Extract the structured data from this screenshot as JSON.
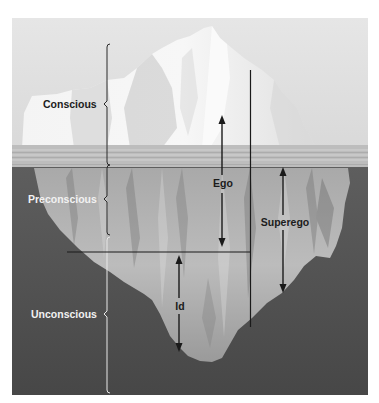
{
  "diagram": {
    "levels": [
      {
        "id": "conscious",
        "label": "Conscious"
      },
      {
        "id": "preconscious",
        "label": "Preconscious"
      },
      {
        "id": "unconscious",
        "label": "Unconscious"
      }
    ],
    "structures": [
      {
        "id": "ego",
        "label": "Ego"
      },
      {
        "id": "superego",
        "label": "Superego"
      },
      {
        "id": "id",
        "label": "Id"
      }
    ],
    "colors": {
      "sky": "#e2e2e2",
      "ice_above": "#f3f3f3",
      "ice_shadow": "#c9c9c9",
      "water_band": "#bdbdbd",
      "deep_water": "#555555",
      "ice_below": "#b4b4b4",
      "line": "#1a1a1a",
      "bracket_light": "#e8e8e8"
    }
  }
}
